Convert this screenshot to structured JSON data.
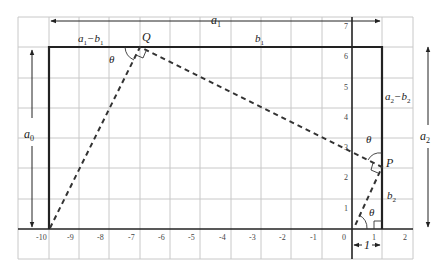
{
  "figure": {
    "type": "geometry-diagram",
    "grid": {
      "x_ticks": [
        "-10",
        "-9",
        "-8",
        "-7",
        "-6",
        "-5",
        "-4",
        "-3",
        "-2",
        "-1",
        "0",
        "1",
        "2"
      ],
      "y_ticks": [
        "1",
        "2",
        "3",
        "4",
        "5",
        "6",
        "7"
      ]
    },
    "labels": {
      "a1": "a",
      "a1_sub": "1",
      "a1_minus_b1": "a",
      "a1_minus_b1_sub1": "1",
      "a1_minus_b1_op": "−b",
      "a1_minus_b1_sub2": "1",
      "b1": "b",
      "b1_sub": "1",
      "a0": "a",
      "a0_sub": "0",
      "a2": "a",
      "a2_sub": "2",
      "a2_minus_b2": "a",
      "a2_minus_b2_sub1": "2",
      "a2_minus_b2_op": "−b",
      "a2_minus_b2_sub2": "2",
      "b2": "b",
      "b2_sub": "2",
      "point_Q": "Q",
      "point_P": "P",
      "theta": "θ",
      "unit_width": "1"
    },
    "points": {
      "Q": [
        -7,
        6.2
      ],
      "P": [
        1,
        2
      ],
      "origin_foot": [
        0,
        0
      ],
      "left_foot": [
        -9.8,
        0
      ]
    },
    "colors": {
      "grid": "#c8c8c8",
      "wall": "#222222",
      "dashed": "#333333",
      "background": "#ffffff"
    }
  }
}
